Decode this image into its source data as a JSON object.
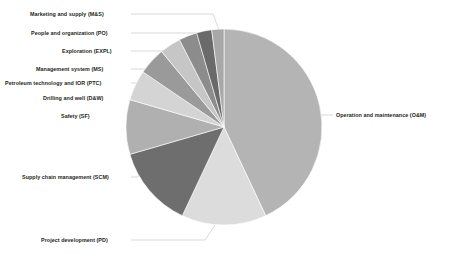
{
  "chart_data": {
    "type": "pie",
    "title": "",
    "subtitle": "",
    "xlabel": "",
    "ylabel": "",
    "legend_position": "none",
    "labels_position": "outside-with-leader-lines",
    "grid": false,
    "categories": [
      "Operation and maintenance (O&M)",
      "Project development (PD)",
      "Supply chain management (SCM)",
      "Safety (SF)",
      "Drilling and well (D&W)",
      "Petroleum technology and IOR (PTC)",
      "Management system (MS)",
      "Exploration (EXPL)",
      "People and organization (PO)",
      "Marketing and supply (M&S)"
    ],
    "values": [
      43.0,
      14.0,
      13.5,
      9.0,
      5.0,
      4.5,
      3.5,
      3.0,
      2.5,
      2.0
    ],
    "colors": [
      "#b4b4b4",
      "#dcdcdc",
      "#6e6e6e",
      "#b0b0b0",
      "#d4d4d4",
      "#9a9a9a",
      "#c6c6c6",
      "#8c8c8c",
      "#6a6a6a",
      "#a8a8a8"
    ],
    "slices": [
      {
        "label": "Operation and maintenance (O&M)",
        "value": 43.0,
        "color": "#b4b4b4"
      },
      {
        "label": "Project development (PD)",
        "value": 14.0,
        "color": "#dcdcdc"
      },
      {
        "label": "Supply chain management (SCM)",
        "value": 13.5,
        "color": "#6e6e6e"
      },
      {
        "label": "Safety (SF)",
        "value": 9.0,
        "color": "#b0b0b0"
      },
      {
        "label": "Drilling and well (D&W)",
        "value": 5.0,
        "color": "#d4d4d4"
      },
      {
        "label": "Petroleum technology and IOR (PTC)",
        "value": 4.5,
        "color": "#9a9a9a"
      },
      {
        "label": "Management system (MS)",
        "value": 3.5,
        "color": "#c6c6c6"
      },
      {
        "label": "Exploration (EXPL)",
        "value": 3.0,
        "color": "#8c8c8c"
      },
      {
        "label": "People and organization (PO)",
        "value": 2.5,
        "color": "#6a6a6a"
      },
      {
        "label": "Marketing and supply (M&S)",
        "value": 2.0,
        "color": "#a8a8a8"
      }
    ],
    "geometry": {
      "center_x": 224,
      "center_y": 127,
      "radius": 98,
      "start_angle_deg": -90,
      "direction": "clockwise"
    },
    "label_placements": [
      {
        "label": "Marketing and supply (M&S)",
        "x": 30,
        "y": 11,
        "align": "left",
        "anchor_x": 131,
        "anchor_y": 14,
        "elbow_x": 213,
        "elbow_y": 14,
        "tip_x": 219,
        "tip_y": 30
      },
      {
        "label": "People and organization (PO)",
        "x": 31,
        "y": 30,
        "align": "left",
        "anchor_x": 131,
        "anchor_y": 33,
        "elbow_x": 196,
        "elbow_y": 33,
        "tip_x": 213,
        "tip_y": 31
      },
      {
        "label": "Exploration (EXPL)",
        "x": 62,
        "y": 48,
        "align": "left",
        "anchor_x": 131,
        "anchor_y": 51,
        "elbow_x": 188,
        "elbow_y": 51,
        "tip_x": 205,
        "tip_y": 32
      },
      {
        "label": "Management system (MS)",
        "x": 36,
        "y": 66,
        "align": "left",
        "anchor_x": 131,
        "anchor_y": 69,
        "elbow_x": 180,
        "elbow_y": 69,
        "tip_x": 196,
        "tip_y": 35
      },
      {
        "label": "Petroleum technology and IOR (PTC)",
        "x": 5,
        "y": 80,
        "align": "left",
        "anchor_x": 131,
        "anchor_y": 83,
        "elbow_x": 172,
        "elbow_y": 83,
        "tip_x": 186,
        "tip_y": 39
      },
      {
        "label": "Drilling and well (D&W)",
        "x": 43,
        "y": 95,
        "align": "left",
        "anchor_x": 131,
        "anchor_y": 98,
        "elbow_x": 164,
        "elbow_y": 98,
        "tip_x": 173,
        "tip_y": 46
      },
      {
        "label": "Safety (SF)",
        "x": 61,
        "y": 113,
        "align": "left",
        "anchor_x": 131,
        "anchor_y": 116,
        "elbow_x": 152,
        "elbow_y": 116,
        "tip_x": 158,
        "tip_y": 57
      },
      {
        "label": "Supply chain management (SCM)",
        "x": 22,
        "y": 174,
        "align": "left",
        "anchor_x": 131,
        "anchor_y": 177,
        "elbow_x": 138,
        "elbow_y": 177,
        "tip_x": 142,
        "tip_y": 167
      },
      {
        "label": "Project development (PD)",
        "x": 41,
        "y": 237,
        "align": "left",
        "anchor_x": 131,
        "anchor_y": 240,
        "elbow_x": 205,
        "elbow_y": 240,
        "tip_x": 215,
        "tip_y": 225
      },
      {
        "label": "Operation and maintenance (O&M)",
        "x": 336,
        "y": 112,
        "align": "right",
        "anchor_x": 333,
        "anchor_y": 115,
        "elbow_x": 320,
        "elbow_y": 115,
        "tip_x": 312,
        "tip_y": 115
      }
    ]
  }
}
